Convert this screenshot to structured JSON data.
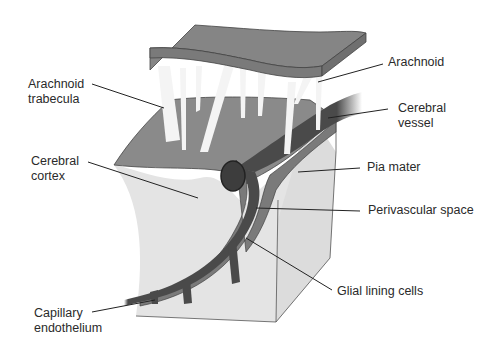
{
  "diagram": {
    "type": "anatomical-cross-section",
    "colors": {
      "arachnoid": "#858585",
      "pia_surface": "#8f8f8f",
      "cortex": "#e4e4e4",
      "cortex_side": "#dadada",
      "vessel": "#4a4a4a",
      "vessel_lumen": "#3d3d3d",
      "perivascular": "#7a7a7a",
      "trabecula": "#f4f4f4",
      "leader_line": "#222222",
      "label_text": "#2a2a2a"
    }
  },
  "labels": {
    "arachnoid_trabecula_1": "Arachnoid",
    "arachnoid_trabecula_2": "trabecula",
    "arachnoid": "Arachnoid",
    "cerebral_vessel_1": "Cerebral",
    "cerebral_vessel_2": "vessel",
    "cerebral_cortex_1": "Cerebral",
    "cerebral_cortex_2": "cortex",
    "pia_mater": "Pia mater",
    "perivascular_space": "Perivascular space",
    "glial_lining_cells": "Glial lining cells",
    "capillary_endothelium_1": "Capillary",
    "capillary_endothelium_2": "endothelium"
  }
}
